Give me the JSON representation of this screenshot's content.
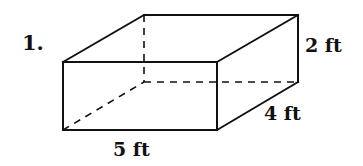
{
  "problem": {
    "number": "1."
  },
  "figure": {
    "shape": "rectangular prism",
    "dimensions": {
      "length": "5 ft",
      "width": "4 ft",
      "height": "2 ft"
    },
    "vertices": {
      "front_top_left": [
        63,
        62
      ],
      "front_top_right": [
        217,
        62
      ],
      "front_bottom_left": [
        63,
        130
      ],
      "front_bottom_right": [
        217,
        130
      ],
      "back_top_left": [
        144,
        15
      ],
      "back_top_right": [
        298,
        15
      ],
      "back_bottom_right": [
        298,
        82
      ],
      "back_bottom_left": [
        144,
        82
      ]
    },
    "line_color": "#111111",
    "background_color": "#ffffff"
  }
}
